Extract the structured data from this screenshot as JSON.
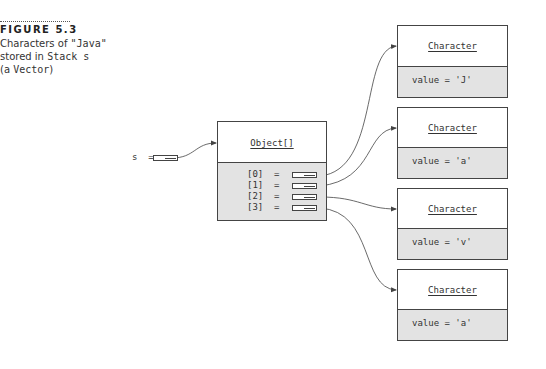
{
  "caption": {
    "figure_label": "FIGURE 5.3",
    "line1_text": "Characters of ",
    "line1_code": "\"Java\"",
    "line2_text": "stored in ",
    "line2_code": "Stack s",
    "line3_text": "(a ",
    "line3_code": "Vector",
    "line3_end": ")"
  },
  "variable": {
    "label": "s  ="
  },
  "array_object": {
    "class_name": "Object[]",
    "slots": [
      {
        "label": "[0]  ="
      },
      {
        "label": "[1]  ="
      },
      {
        "label": "[2]  ="
      },
      {
        "label": "[3]  ="
      }
    ]
  },
  "characters": [
    {
      "class_name": "Character",
      "value": "value = 'J'"
    },
    {
      "class_name": "Character",
      "value": "value = 'a'"
    },
    {
      "class_name": "Character",
      "value": "value = 'v'"
    },
    {
      "class_name": "Character",
      "value": "value = 'a'"
    }
  ],
  "colors": {
    "box_border": "#444444",
    "field_fill": "#e3e3e3",
    "background": "#ffffff",
    "line": "#444444"
  }
}
